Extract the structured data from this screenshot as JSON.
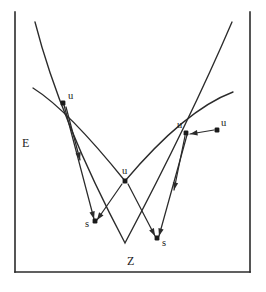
{
  "figure": {
    "type": "energy-diagram",
    "background_color": "#ffffff",
    "ink_color": "#2b2b2b",
    "axes": {
      "y_label": "E",
      "x_label": "Z",
      "y_label_pos": [
        22,
        137
      ],
      "x_label_pos": [
        127,
        255
      ],
      "frame": {
        "left_x": 15,
        "right_x": 250,
        "bottom_y": 272,
        "top_y": 12,
        "has_top_border": false,
        "has_bottom_border": true
      }
    },
    "curves": [
      {
        "name": "outer-parabola",
        "path": "M 35 22 Q 60 120 125 243 Q 190 120 232 22",
        "vertex": [
          125,
          243
        ]
      },
      {
        "name": "inner-parabola",
        "path": "M 33 88 Q 68 110 125 181 Q 185 110 233 92",
        "vertex": [
          125,
          181
        ]
      }
    ],
    "points": [
      {
        "id": "u-left",
        "label": "u",
        "dot": [
          63,
          103
        ],
        "label_pos": [
          68,
          91
        ]
      },
      {
        "id": "u-middle",
        "label": "u",
        "dot": [
          125,
          181
        ],
        "label_pos": [
          122,
          166
        ]
      },
      {
        "id": "u-right-inner",
        "label": "u",
        "dot": [
          186,
          133
        ],
        "label_pos": [
          177,
          120
        ]
      },
      {
        "id": "u-right-outer",
        "label": "u",
        "dot": [
          217,
          130
        ],
        "label_pos": [
          221,
          118
        ]
      },
      {
        "id": "s-left",
        "label": "s",
        "dot": [
          95,
          221
        ],
        "label_pos": [
          85,
          219
        ]
      },
      {
        "id": "s-right",
        "label": "s",
        "dot": [
          157,
          238
        ],
        "label_pos": [
          162,
          238
        ]
      }
    ],
    "arrows": [
      {
        "id": "arrow-u-left-to-s-left",
        "from": [
          64,
          105
        ],
        "to": [
          94,
          219
        ]
      },
      {
        "id": "arrow-u-left-down-inner",
        "from": [
          66,
          107
        ],
        "to": [
          80,
          160
        ]
      },
      {
        "id": "arrow-u-middle-to-s-left",
        "from": [
          122,
          184
        ],
        "to": [
          97,
          220
        ]
      },
      {
        "id": "arrow-u-middle-to-s-right",
        "from": [
          128,
          184
        ],
        "to": [
          155,
          236
        ]
      },
      {
        "id": "arrow-u-right-outer-to-inner",
        "from": [
          214,
          130
        ],
        "to": [
          190,
          134
        ]
      },
      {
        "id": "arrow-u-right-to-s-right",
        "from": [
          187,
          135
        ],
        "to": [
          159,
          236
        ]
      },
      {
        "id": "arrow-u-right-down-outer",
        "from": [
          185,
          136
        ],
        "to": [
          174,
          190
        ]
      }
    ]
  }
}
